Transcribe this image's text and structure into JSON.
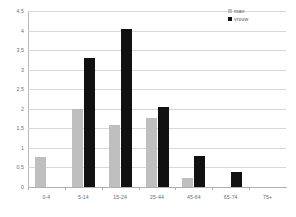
{
  "chart_data": {
    "type": "bar",
    "title": "",
    "subtitle": "",
    "xlabel": "",
    "ylabel": "",
    "categories": [
      "0-4",
      "5-14",
      "15-24",
      "25-44",
      "45-64",
      "65-74",
      "75+"
    ],
    "series": [
      {
        "name": "man",
        "color": "#bfbfbf",
        "values": [
          0.78,
          2.0,
          1.58,
          1.77,
          0.23,
          0,
          0
        ]
      },
      {
        "name": "vrouw",
        "color": "#111111",
        "values": [
          0,
          3.3,
          4.05,
          2.05,
          0.8,
          0.38,
          0
        ]
      }
    ],
    "ylim": [
      0,
      4.5
    ],
    "ytick_labels": [
      "0",
      "0,5",
      "1",
      "1,5",
      "2",
      "2,5",
      "3",
      "3,5",
      "4",
      "4,5"
    ],
    "ytick_values": [
      0,
      0.5,
      1,
      1.5,
      2,
      2.5,
      3,
      3.5,
      4,
      4.5
    ],
    "grid": true,
    "legend_position": "top-right"
  },
  "legend": {
    "items": [
      {
        "label": "man",
        "swatch": "man-swatch-icon"
      },
      {
        "label": "vrouw",
        "swatch": "vrouw-swatch-icon"
      }
    ]
  },
  "colors": {
    "man": "#bfbfbf",
    "vrouw": "#111111",
    "gridline": "#d7d7d7",
    "axis": "#b0b0b0",
    "tick_text": "#6b6b6b",
    "background": "#ffffff"
  }
}
